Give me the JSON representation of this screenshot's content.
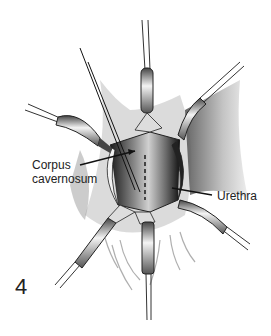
{
  "figure": {
    "number": "4",
    "type": "surgical illustration",
    "colors": {
      "ink": "#111111",
      "shade": "#6a6a6a",
      "light": "#d8d8d8",
      "background": "#ffffff"
    }
  },
  "labels": {
    "corpus_line1": "Corpus",
    "corpus_line2": "cavernosum",
    "urethra": "Urethra"
  },
  "instruments": [
    {
      "name": "retractor-top",
      "direction": "up"
    },
    {
      "name": "retractor-upper-left",
      "direction": "upper-left"
    },
    {
      "name": "retractor-upper-right",
      "direction": "upper-right"
    },
    {
      "name": "retractor-lower-left",
      "direction": "lower-left"
    },
    {
      "name": "retractor-lower-right",
      "direction": "lower-right"
    },
    {
      "name": "retractor-bottom",
      "direction": "down"
    },
    {
      "name": "needle-holder",
      "direction": "upper-left diagonal"
    }
  ]
}
